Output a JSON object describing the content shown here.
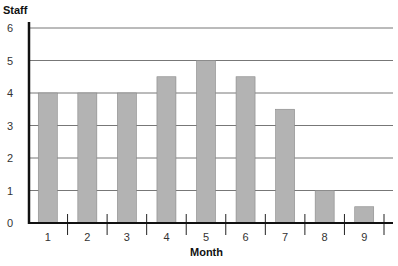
{
  "chart_data": {
    "type": "bar",
    "title": "",
    "xlabel": "Month",
    "ylabel": "Staff",
    "categories": [
      "1",
      "2",
      "3",
      "4",
      "5",
      "6",
      "7",
      "8",
      "9"
    ],
    "values": [
      4,
      4,
      4,
      4.5,
      5,
      4.5,
      3.5,
      1,
      0.5
    ],
    "ylim": [
      0,
      6
    ],
    "yticks": [
      0,
      1,
      2,
      3,
      4,
      5,
      6
    ],
    "grid": true,
    "legend": null,
    "colors": {
      "bar": "#b3b3b3",
      "bar_edge": "#888888",
      "grid": "#777777",
      "axis": "#111111"
    }
  }
}
